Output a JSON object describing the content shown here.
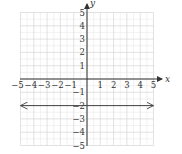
{
  "chart_data": {
    "type": "line",
    "title": "",
    "xlabel": "x",
    "ylabel": "y",
    "xlim": [
      -5,
      5
    ],
    "ylim": [
      -5,
      5
    ],
    "grid": true,
    "minor_grid": true,
    "x_ticks": [
      "-5",
      "-4",
      "-3",
      "-2",
      "-1",
      "1",
      "2",
      "3",
      "4",
      "5"
    ],
    "y_ticks": [
      "5",
      "4",
      "3",
      "2",
      "1",
      "-1",
      "-2",
      "-3",
      "-4",
      "-5"
    ],
    "series": [
      {
        "name": "y = -2",
        "equation": "y = -2",
        "x": [
          -5,
          5
        ],
        "y": [
          -2,
          -2
        ],
        "arrows": "both",
        "color": "#444444"
      }
    ],
    "legend": null
  },
  "colors": {
    "axis": "#333333",
    "grid_major": "#d6d6d6",
    "grid_minor": "#ececec",
    "line": "#444444"
  }
}
